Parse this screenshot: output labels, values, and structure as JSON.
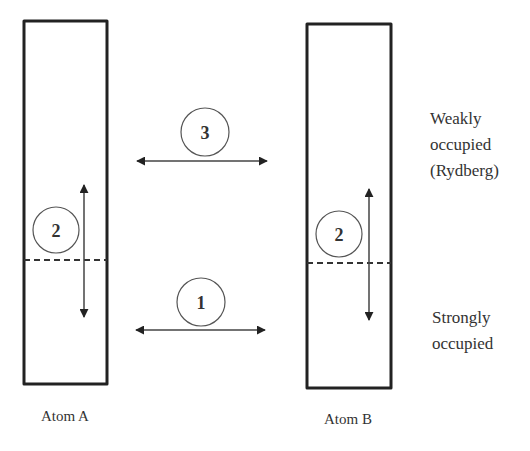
{
  "diagram": {
    "atoms": [
      {
        "id": "atom-a",
        "label": "Atom A",
        "box": {
          "x": 24,
          "y": 21,
          "width": 83,
          "height": 363
        },
        "divider_y": 260,
        "label_pos": {
          "x": 65,
          "y": 421
        },
        "intra_process": {
          "number": "2",
          "circle": {
            "cx": 56,
            "cy": 230,
            "r": 23
          },
          "arrow": {
            "x": 84,
            "y1": 185,
            "y2": 317
          }
        }
      },
      {
        "id": "atom-b",
        "label": "Atom B",
        "box": {
          "x": 307,
          "y": 24,
          "width": 84,
          "height": 364
        },
        "divider_y": 263,
        "label_pos": {
          "x": 348,
          "y": 424
        },
        "intra_process": {
          "number": "2",
          "circle": {
            "cx": 339,
            "cy": 234,
            "r": 23
          },
          "arrow": {
            "x": 369,
            "y1": 189,
            "y2": 320
          }
        }
      }
    ],
    "inter_processes": [
      {
        "id": "process-3",
        "number": "3",
        "circle": {
          "cx": 205,
          "cy": 132,
          "r": 24
        },
        "arrow": {
          "y": 161,
          "x1": 137,
          "x2": 267
        }
      },
      {
        "id": "process-1",
        "number": "1",
        "circle": {
          "cx": 201,
          "cy": 302,
          "r": 24
        },
        "arrow": {
          "y": 330,
          "x1": 136,
          "x2": 265
        }
      }
    ],
    "level_labels": {
      "upper": {
        "lines": [
          "Weakly",
          "occupied",
          "(Rydberg)"
        ],
        "x": 430,
        "y_first": 124,
        "line_height": 26
      },
      "lower": {
        "lines": [
          "Strongly",
          "occupied"
        ],
        "x": 432,
        "y_first": 323,
        "line_height": 26
      }
    },
    "colors": {
      "stroke": "#222222",
      "text": "#333333",
      "background": "#ffffff"
    }
  }
}
